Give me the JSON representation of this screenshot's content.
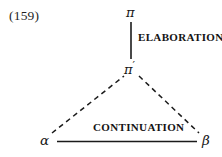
{
  "figure": {
    "example_number": "(159)",
    "width": 222,
    "height": 157,
    "background_color": "#ffffff",
    "ink_color": "#1b1b1b"
  },
  "nodes": [
    {
      "id": "pi",
      "label": "π",
      "x": 131,
      "y": 13,
      "role": "root-segment"
    },
    {
      "id": "pi-prime",
      "label": "π",
      "prime": "′",
      "x": 131,
      "y": 67,
      "role": "complex-segment"
    },
    {
      "id": "alpha",
      "label": "α",
      "x": 46,
      "y": 141,
      "role": "left-segment"
    },
    {
      "id": "beta",
      "label": "β",
      "x": 207,
      "y": 142,
      "role": "right-segment"
    }
  ],
  "edges": [
    {
      "id": "elaboration-edge",
      "from": "pi",
      "to": "pi-prime",
      "style": "solid",
      "label": "Elaboration",
      "x1": 131,
      "y1": 22,
      "x2": 131,
      "y2": 59
    },
    {
      "id": "alpha-pi-prime-edge",
      "from": "alpha",
      "to": "pi-prime",
      "style": "dashed",
      "label": "",
      "x1": 52,
      "y1": 133,
      "x2": 124,
      "y2": 75
    },
    {
      "id": "pi-prime-beta-edge",
      "from": "pi-prime",
      "to": "beta",
      "style": "dashed",
      "label": "",
      "x1": 139,
      "y1": 75,
      "x2": 199,
      "y2": 133
    },
    {
      "id": "continuation-edge",
      "from": "alpha",
      "to": "beta",
      "style": "solid",
      "label": "Continuation",
      "x1": 57,
      "y1": 141,
      "x2": 197,
      "y2": 141
    }
  ],
  "labels": {
    "elaboration": "ELABORATION",
    "continuation": "CONTINUATION"
  }
}
